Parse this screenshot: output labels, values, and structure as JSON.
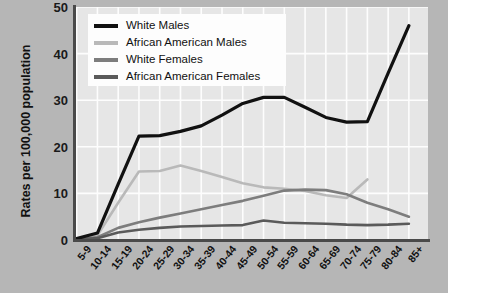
{
  "chart_data": {
    "type": "line",
    "title": "",
    "xlabel": "",
    "ylabel": "Rates per 100,000 population",
    "ylim": [
      0,
      50
    ],
    "yticks": [
      0,
      10,
      20,
      30,
      40,
      50
    ],
    "grid": true,
    "legend_position": "top-left-inside",
    "categories": [
      "5-9",
      "10-14",
      "15-19",
      "20-24",
      "25-29",
      "30-34",
      "35-39",
      "40-44",
      "45-49",
      "50-54",
      "55-59",
      "60-64",
      "65-69",
      "70-74",
      "75-79",
      "80-84",
      "85+"
    ],
    "series": [
      {
        "name": "White Males",
        "color": "#111111",
        "values": [
          0.3,
          1.5,
          12.0,
          22.3,
          22.4,
          23.3,
          24.5,
          26.8,
          29.3,
          30.6,
          30.6,
          28.5,
          26.3,
          25.3,
          25.4,
          35.8,
          46.0
        ]
      },
      {
        "name": "African American Males",
        "color": "#b9b9b9",
        "values": [
          0.2,
          1.0,
          8.0,
          14.7,
          14.8,
          16.0,
          14.8,
          13.5,
          12.2,
          11.3,
          11.0,
          10.5,
          9.6,
          9.0,
          13.0,
          null,
          null
        ]
      },
      {
        "name": "White Females",
        "color": "#7d7d7d",
        "values": [
          0.1,
          0.6,
          2.6,
          3.8,
          4.8,
          5.7,
          6.6,
          7.5,
          8.4,
          9.5,
          10.6,
          10.8,
          10.7,
          9.8,
          8.0,
          6.6,
          5.0
        ]
      },
      {
        "name": "African American Females",
        "color": "#5a5a5a",
        "values": [
          0.1,
          0.4,
          1.6,
          2.2,
          2.6,
          2.9,
          3.0,
          3.1,
          3.2,
          4.2,
          3.7,
          3.6,
          3.5,
          3.3,
          3.2,
          3.3,
          3.5
        ]
      }
    ]
  },
  "legend": {
    "items": [
      {
        "label": "White Males",
        "color": "#111111"
      },
      {
        "label": "African American Males",
        "color": "#b9b9b9"
      },
      {
        "label": "White Females",
        "color": "#7d7d7d"
      },
      {
        "label": "African American Females",
        "color": "#5a5a5a"
      }
    ]
  },
  "axes": {
    "y_title": "Rates per 100,000 population",
    "y_tick_labels": [
      "50",
      "40",
      "30",
      "20",
      "10",
      "0"
    ]
  },
  "colors": {
    "panel_background": "#b6b6b6",
    "plot_background": "#e6e6e6",
    "gridline": "#fdfdfd",
    "axis": "#4a4a4a",
    "page_background": "#ffffff"
  }
}
